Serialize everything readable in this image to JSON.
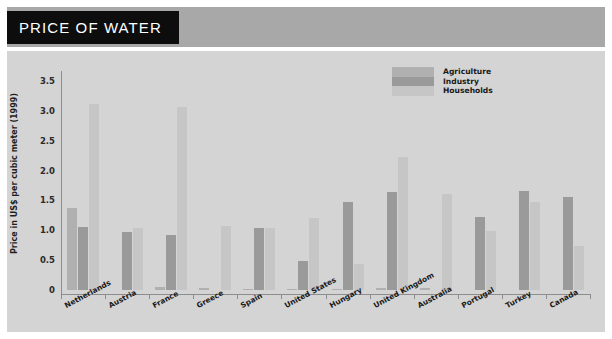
{
  "header": {
    "title": "PRICE OF WATER",
    "banner_color": "#a8a8a8",
    "title_block_color": "#0d0d0d",
    "title_text_color": "#ffffff"
  },
  "panel": {
    "background_color": "#d4d4d4"
  },
  "chart_data": {
    "type": "bar",
    "title": "PRICE OF WATER",
    "xlabel": "",
    "ylabel": "Price in US$ per cubic meter (1999)",
    "ylim": [
      0,
      3.6
    ],
    "yticks": [
      0,
      0.5,
      1.0,
      1.5,
      2.0,
      2.5,
      3.0,
      3.5
    ],
    "ytick_labels": [
      "0",
      "0.5",
      "1.0",
      "1.5",
      "2.0",
      "2.5",
      "3.0",
      "3.5"
    ],
    "grid": false,
    "legend_position": "top-right",
    "categories": [
      "Netherlands",
      "Austria",
      "France",
      "Greece",
      "Spain",
      "United States",
      "Hungary",
      "United Kingdom",
      "Australia",
      "Portugal",
      "Turkey",
      "Canada"
    ],
    "series": [
      {
        "name": "Agriculture",
        "color": "#b0b0b0",
        "values": [
          1.38,
          0.0,
          0.05,
          0.04,
          0.02,
          0.02,
          0.02,
          0.03,
          0.03,
          0.0,
          0.0,
          0.0
        ]
      },
      {
        "name": "Industry",
        "color": "#9a9a9a",
        "values": [
          1.05,
          0.97,
          0.92,
          0.0,
          1.04,
          0.49,
          1.48,
          1.64,
          0.0,
          1.22,
          1.66,
          1.56
        ]
      },
      {
        "name": "Households",
        "color": "#c6c6c6",
        "values": [
          3.12,
          1.04,
          3.07,
          1.08,
          1.04,
          1.21,
          0.44,
          2.23,
          1.61,
          0.99,
          1.47,
          0.73
        ]
      }
    ]
  }
}
